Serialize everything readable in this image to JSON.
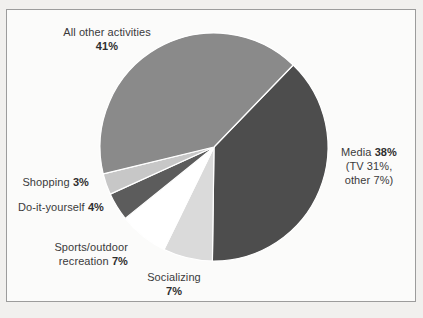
{
  "chart_data": {
    "type": "pie",
    "title": "",
    "legend": "none",
    "start_angle_deg": 46,
    "direction": "clockwise",
    "separator_color": "#ffffff",
    "slices": [
      {
        "label": "Media",
        "value": 38,
        "note": "TV 31%, other 7%",
        "color": "#4d4d4d"
      },
      {
        "label": "Socializing",
        "value": 7,
        "color": "#dadada"
      },
      {
        "label": "Sports/outdoor recreation",
        "value": 7,
        "color": "#ffffff"
      },
      {
        "label": "Do-it-yourself",
        "value": 4,
        "color": "#5c5c5c"
      },
      {
        "label": "Shopping",
        "value": 3,
        "color": "#c7c7c7"
      },
      {
        "label": "All other activities",
        "value": 41,
        "color": "#8a8a8a"
      }
    ]
  },
  "labels": {
    "all_other": {
      "name": "All other activities",
      "pct": "41%"
    },
    "media": {
      "name": "Media",
      "pct": "38%",
      "sub1": "(TV 31%,",
      "sub2": "other 7%)"
    },
    "shopping": {
      "name": "Shopping",
      "pct": "3%"
    },
    "diy": {
      "name": "Do-it-yourself",
      "pct": "4%"
    },
    "sports": {
      "name1": "Sports/outdoor",
      "name2": "recreation",
      "pct": "7%"
    },
    "socializing": {
      "name": "Socializing",
      "pct": "7%"
    }
  }
}
